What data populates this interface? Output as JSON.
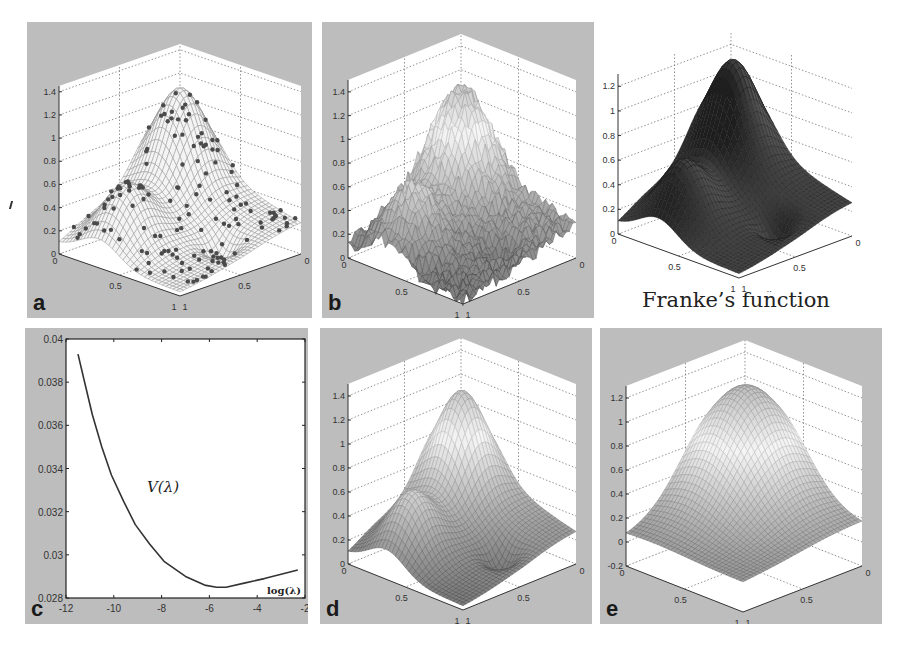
{
  "figure": {
    "panels": [
      {
        "id": "a",
        "letter": "a",
        "kind": "surface-with-points",
        "zticks": [
          "0",
          "0.2",
          "0.4",
          "0.6",
          "0.8",
          "1",
          "1.2",
          "1.4"
        ],
        "xticks": [
          "0",
          "0.5",
          "1"
        ],
        "yticks": [
          "1",
          "0.5",
          "0"
        ]
      },
      {
        "id": "b",
        "letter": "b",
        "kind": "surface",
        "zticks": [
          "0",
          "0.2",
          "0.4",
          "0.6",
          "0.8",
          "1",
          "1.2",
          "1.4"
        ],
        "xticks": [
          "0",
          "0.5",
          "1"
        ],
        "yticks": [
          "1",
          "0.5",
          "0"
        ]
      },
      {
        "id": "franke",
        "letter": "",
        "kind": "surface-reference",
        "zticks": [
          "0",
          "0.2",
          "0.4",
          "0.6",
          "0.8",
          "1",
          "1.2"
        ],
        "xticks": [
          "0",
          "0.5",
          "1"
        ],
        "yticks": [
          "1",
          "0.5",
          "0"
        ],
        "xlabel": "y",
        "ylabel": "x",
        "caption": "Franke’s function"
      },
      {
        "id": "c",
        "letter": "c",
        "kind": "line"
      },
      {
        "id": "d",
        "letter": "d",
        "kind": "surface",
        "zticks": [
          "0",
          "0.2",
          "0.4",
          "0.6",
          "0.8",
          "1",
          "1.2",
          "1.4"
        ],
        "xticks": [
          "0",
          "0.5",
          "1"
        ],
        "yticks": [
          "1",
          "0.5",
          "0"
        ]
      },
      {
        "id": "e",
        "letter": "e",
        "kind": "surface",
        "zticks": [
          "-0.2",
          "0",
          "0.2",
          "0.4",
          "0.6",
          "0.8",
          "1",
          "1.2"
        ],
        "xticks": [
          "0",
          "0.5",
          "1"
        ],
        "yticks": [
          "1",
          "0.5",
          "0"
        ]
      }
    ],
    "colors": {
      "panel_bg": "#bdbdbd",
      "plot_bg": "#ffffff",
      "mesh_dark": "#2a2a2a",
      "mesh_light": "#e6e6e6",
      "points": "#555555"
    }
  },
  "chart_data": [
    {
      "panel": "a",
      "type": "surface",
      "title": "",
      "description": "Surface reconstruction with scattered sample points overlaid",
      "xlabel": "",
      "ylabel": "",
      "zlabel": "",
      "x_range": [
        0,
        1
      ],
      "y_range": [
        0,
        1
      ],
      "zlim": [
        0,
        1.4
      ],
      "zticks": [
        0,
        0.2,
        0.4,
        0.6,
        0.8,
        1,
        1.2,
        1.4
      ],
      "peak_z": 1.4,
      "has_scatter_points": true,
      "grid": true
    },
    {
      "panel": "b",
      "type": "surface",
      "title": "",
      "description": "Noisy surface reconstruction",
      "x_range": [
        0,
        1
      ],
      "y_range": [
        0,
        1
      ],
      "zlim": [
        0,
        1.4
      ],
      "zticks": [
        0,
        0.2,
        0.4,
        0.6,
        0.8,
        1,
        1.2,
        1.4
      ],
      "peak_z": 1.45,
      "grid": true
    },
    {
      "panel": "franke",
      "type": "surface",
      "title": "Franke’s function",
      "xlabel": "y",
      "ylabel": "x",
      "x_range": [
        0,
        1
      ],
      "y_range": [
        0,
        1
      ],
      "zlim": [
        0,
        1.2
      ],
      "zticks": [
        0,
        0.2,
        0.4,
        0.6,
        0.8,
        1,
        1.2
      ],
      "peak_z": 1.22,
      "secondary_peak_z": 0.6,
      "grid": true
    },
    {
      "panel": "c",
      "type": "line",
      "title": "",
      "xlabel": "log(λ)",
      "ylabel": "",
      "annotation": "V(λ)",
      "series": [
        {
          "name": "V(λ)",
          "x": [
            -11.5,
            -11.2,
            -10.9,
            -10.5,
            -10.1,
            -9.6,
            -9.1,
            -8.5,
            -7.9,
            -7.0,
            -6.2,
            -5.7,
            -5.3,
            -4.5,
            -3.7,
            -3.0,
            -2.3
          ],
          "y": [
            0.0393,
            0.0379,
            0.0365,
            0.035,
            0.0337,
            0.0325,
            0.0314,
            0.0305,
            0.0297,
            0.029,
            0.0286,
            0.0285,
            0.0285,
            0.0287,
            0.0289,
            0.0291,
            0.0293
          ]
        }
      ],
      "xlim": [
        -12,
        -2
      ],
      "ylim": [
        0.028,
        0.04
      ],
      "xticks": [
        "-12",
        "-10",
        "-8",
        "-6",
        "-4",
        "-2"
      ],
      "yticks": [
        "0.028",
        "0.03",
        "0.032",
        "0.034",
        "0.036",
        "0.038",
        "0.04"
      ],
      "minimum": {
        "x": -5.5,
        "y": 0.0285
      },
      "grid": false
    },
    {
      "panel": "d",
      "type": "surface",
      "title": "",
      "description": "Smoothed surface reconstruction",
      "x_range": [
        0,
        1
      ],
      "y_range": [
        0,
        1
      ],
      "zlim": [
        0,
        1.4
      ],
      "zticks": [
        0,
        0.2,
        0.4,
        0.6,
        0.8,
        1,
        1.2,
        1.4
      ],
      "peak_z": 1.4,
      "grid": true
    },
    {
      "panel": "e",
      "type": "surface",
      "title": "",
      "description": "Over-smoothed surface reconstruction",
      "x_range": [
        0,
        1
      ],
      "y_range": [
        0,
        1
      ],
      "zlim": [
        -0.2,
        1.2
      ],
      "zticks": [
        -0.2,
        0,
        0.2,
        0.4,
        0.6,
        0.8,
        1,
        1.2
      ],
      "peak_z": 1.15,
      "grid": true
    }
  ],
  "panel_c": {
    "curve_label": "V(λ)",
    "xaxis_label": "log(λ)",
    "xticks": [
      "-12",
      "-10",
      "-8",
      "-6",
      "-4",
      "-2"
    ],
    "yticks": [
      "0.028",
      "0.03",
      "0.032",
      "0.034",
      "0.036",
      "0.038",
      "0.04"
    ]
  }
}
